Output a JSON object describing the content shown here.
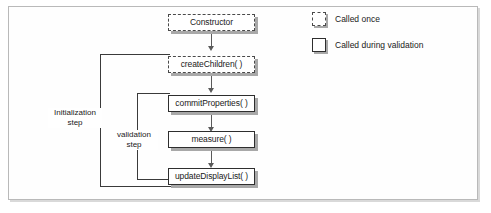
{
  "figure": {
    "frame_border_color": "#b9b9b9",
    "background": "#ffffff"
  },
  "nodes": [
    {
      "id": "constructor",
      "label": "Constructor",
      "style": "dashed",
      "called": "once"
    },
    {
      "id": "createChildren",
      "label": "createChildren( )",
      "style": "dashed",
      "called": "once"
    },
    {
      "id": "commitProperties",
      "label": "commitProperties( )",
      "style": "solid",
      "called": "validation"
    },
    {
      "id": "measure",
      "label": "measure( )",
      "style": "solid",
      "called": "validation"
    },
    {
      "id": "updateDisplayList",
      "label": "updateDisplayList( )",
      "style": "solid",
      "called": "validation"
    }
  ],
  "step_labels": [
    {
      "id": "initialization-step",
      "line1": "Initialization",
      "line2": "step"
    },
    {
      "id": "validation-step",
      "line1": "validation",
      "line2": "step"
    }
  ],
  "legend": {
    "items": [
      {
        "id": "legend-called-once",
        "swatch": "dashed",
        "label": "Called once"
      },
      {
        "id": "legend-called-validation",
        "swatch": "solid",
        "label": "Called during validation"
      }
    ]
  },
  "colors": {
    "box_border_solid": "#2e2e2e",
    "box_border_dashed": "#4a4a4a",
    "shadow": "#a8a8a8",
    "connector": "#3a3a3a",
    "arrow": "#5a5a5a",
    "text": "#1a1a1a"
  }
}
